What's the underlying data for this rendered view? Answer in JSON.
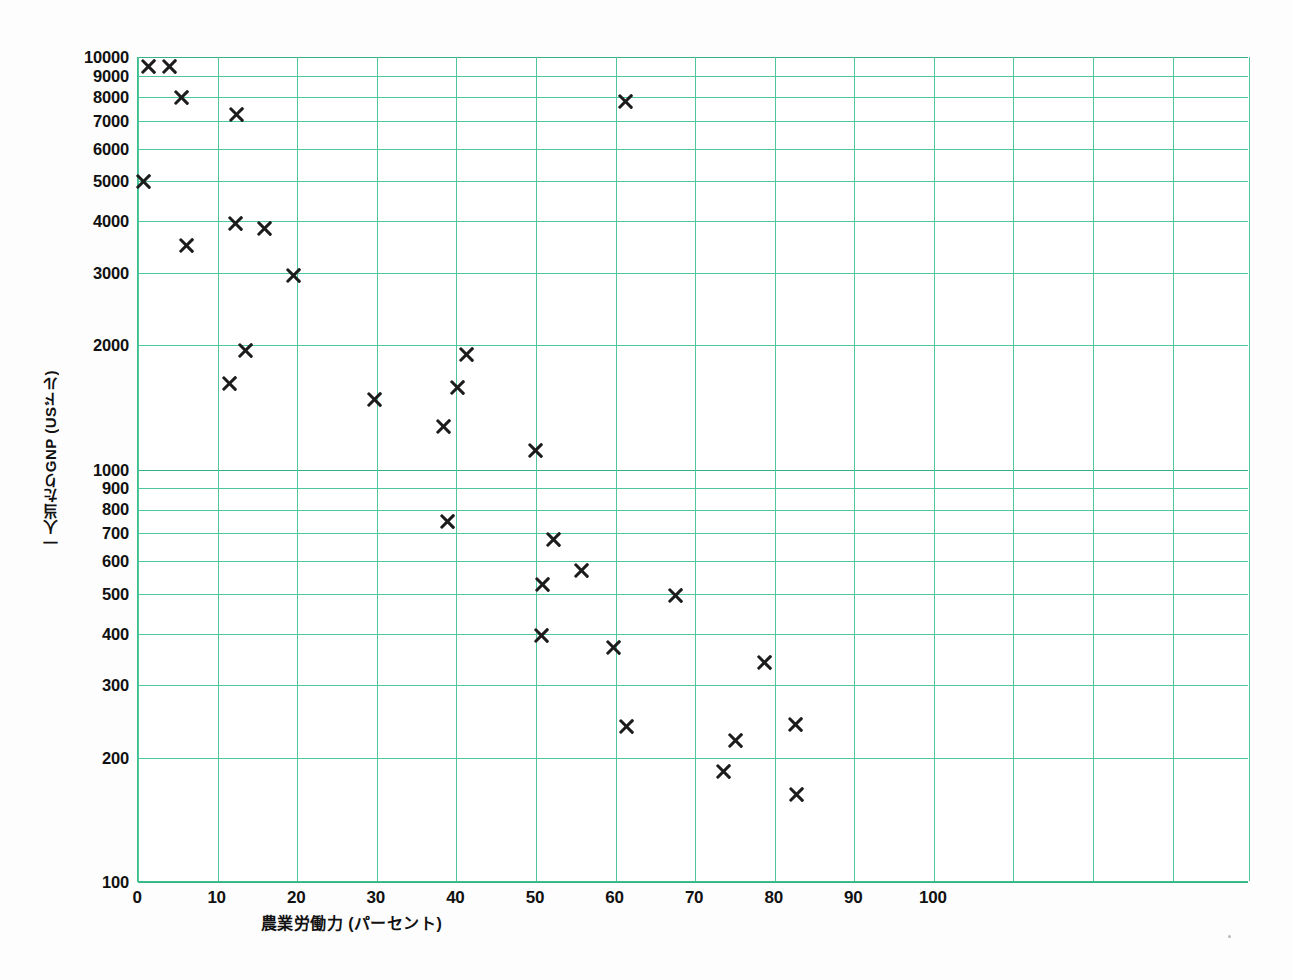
{
  "chart_data": {
    "type": "scatter",
    "title": "",
    "xlabel": "農業労働力 (パーセント)",
    "ylabel": "一人当たりGNP (USドル)",
    "xscale": "linear",
    "yscale": "log",
    "xlim": [
      0,
      139.6
    ],
    "ylim": [
      100,
      10000
    ],
    "grid": true,
    "legend": false,
    "marker": "x",
    "marker_color": "#1c1c1c",
    "grid_color": "#4ec79a",
    "xticks": [
      0,
      10,
      20,
      30,
      40,
      50,
      60,
      70,
      80,
      90,
      100
    ],
    "xtick_labels": [
      "0",
      "10",
      "20",
      "30",
      "40",
      "50",
      "60",
      "70",
      "80",
      "90",
      "100"
    ],
    "yticks": [
      100,
      200,
      300,
      400,
      500,
      600,
      700,
      800,
      900,
      1000,
      2000,
      3000,
      4000,
      5000,
      6000,
      7000,
      8000,
      9000,
      10000
    ],
    "ytick_labels": [
      "100",
      "200",
      "300",
      "400",
      "500",
      "600",
      "700",
      "800",
      "900",
      "1000",
      "2000",
      "3000",
      "4000",
      "5000",
      "6000",
      "7000",
      "8000",
      "9000",
      "10000"
    ],
    "x_gridlines": [
      0,
      10,
      20,
      30,
      40,
      50,
      60,
      70,
      80,
      90,
      100,
      110,
      120,
      130,
      139.6
    ],
    "points": [
      {
        "x": 1.3,
        "y": 9500
      },
      {
        "x": 4.0,
        "y": 9500
      },
      {
        "x": 5.5,
        "y": 8000
      },
      {
        "x": 12.4,
        "y": 7250
      },
      {
        "x": 61.3,
        "y": 7800
      },
      {
        "x": 0.7,
        "y": 5000
      },
      {
        "x": 12.3,
        "y": 3950
      },
      {
        "x": 15.9,
        "y": 3830
      },
      {
        "x": 6.1,
        "y": 3500
      },
      {
        "x": 19.6,
        "y": 2960
      },
      {
        "x": 13.5,
        "y": 1940
      },
      {
        "x": 41.3,
        "y": 1900
      },
      {
        "x": 11.5,
        "y": 1620
      },
      {
        "x": 40.2,
        "y": 1580
      },
      {
        "x": 29.7,
        "y": 1480
      },
      {
        "x": 38.4,
        "y": 1270
      },
      {
        "x": 50.0,
        "y": 1110
      },
      {
        "x": 38.9,
        "y": 750
      },
      {
        "x": 52.2,
        "y": 675
      },
      {
        "x": 55.7,
        "y": 570
      },
      {
        "x": 50.8,
        "y": 525
      },
      {
        "x": 67.5,
        "y": 495
      },
      {
        "x": 50.7,
        "y": 397
      },
      {
        "x": 59.7,
        "y": 370
      },
      {
        "x": 78.7,
        "y": 340
      },
      {
        "x": 61.4,
        "y": 238
      },
      {
        "x": 75.1,
        "y": 220
      },
      {
        "x": 82.6,
        "y": 241
      },
      {
        "x": 73.6,
        "y": 185
      },
      {
        "x": 82.8,
        "y": 163
      }
    ]
  }
}
